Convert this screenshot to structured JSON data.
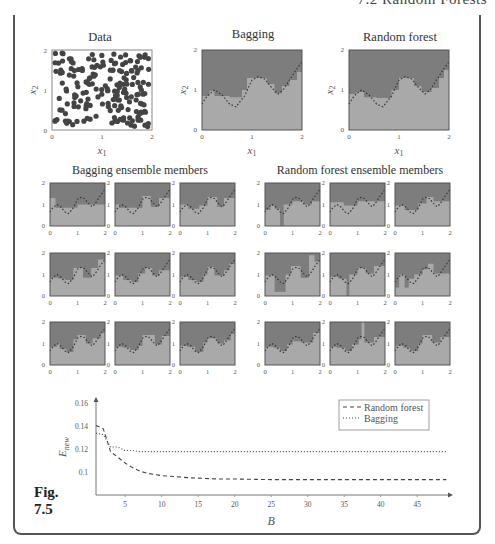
{
  "page": {
    "running_head": "7.2 Random Forests",
    "figure_label": "Fig.",
    "figure_number": "7.5"
  },
  "colors": {
    "class_high": "#7d7d7d",
    "class_low": "#a9a9a9",
    "band": "#b9b9b9",
    "points": "#444444",
    "frame": "#555555",
    "axis": "#777777"
  },
  "top_row": {
    "data_plot": {
      "title": "Data",
      "xlabel": "x1",
      "ylabel": "x2",
      "xticks": [
        "0",
        "1",
        "2"
      ],
      "yticks": [
        "0",
        "1",
        "2"
      ]
    },
    "bagging_plot": {
      "title": "Bagging",
      "xlabel": "x1",
      "ylabel": "x2",
      "xticks": [
        "0",
        "1",
        "2"
      ],
      "yticks": [
        "0",
        "1",
        "2"
      ]
    },
    "rf_plot": {
      "title": "Random forest",
      "xlabel": "x1",
      "ylabel": "x2",
      "xticks": [
        "0",
        "1",
        "2"
      ],
      "yticks": [
        "0",
        "1",
        "2"
      ]
    }
  },
  "ensembles": {
    "bagging_title": "Bagging ensemble members",
    "rf_title": "Random forest ensemble members",
    "xticks": [
      "0",
      "1",
      "2"
    ],
    "yticks": [
      "0",
      "1",
      "2"
    ]
  },
  "chart_data": [
    {
      "type": "line",
      "title": "",
      "xlabel": "B",
      "ylabel": "E_new",
      "x_ticks": [
        5,
        10,
        15,
        20,
        25,
        30,
        35,
        40,
        45
      ],
      "y_ticks": [
        0.1,
        0.12,
        0.14,
        0.16
      ],
      "xlim": [
        1,
        49
      ],
      "ylim": [
        0.08,
        0.165
      ],
      "grid": false,
      "legend_position": "upper right",
      "x": [
        1,
        2,
        3,
        4,
        5,
        6,
        7,
        8,
        9,
        10,
        12,
        14,
        16,
        18,
        20,
        25,
        30,
        35,
        40,
        45,
        49
      ],
      "series": [
        {
          "name": "Random forest",
          "style": "dashed",
          "values": [
            0.141,
            0.138,
            0.118,
            0.113,
            0.108,
            0.104,
            0.101,
            0.099,
            0.098,
            0.097,
            0.096,
            0.095,
            0.0945,
            0.094,
            0.094,
            0.0935,
            0.0935,
            0.0935,
            0.0935,
            0.0935,
            0.0935
          ]
        },
        {
          "name": "Bagging",
          "style": "dotted",
          "values": [
            0.134,
            0.133,
            0.122,
            0.122,
            0.119,
            0.119,
            0.118,
            0.118,
            0.118,
            0.118,
            0.118,
            0.118,
            0.118,
            0.118,
            0.118,
            0.118,
            0.118,
            0.118,
            0.118,
            0.118,
            0.118
          ]
        }
      ]
    },
    {
      "type": "scatter",
      "title": "Data",
      "xlabel": "x1",
      "ylabel": "x2",
      "xlim": [
        0,
        2
      ],
      "ylim": [
        0,
        2
      ],
      "note": "~200 uniformly scattered points on [0,2]x[0,2], with dashed true decision boundary"
    },
    {
      "type": "heatmap",
      "title": "Bagging",
      "xlabel": "x1",
      "ylabel": "x2",
      "xlim": [
        0,
        2
      ],
      "ylim": [
        0,
        2
      ],
      "note": "two-class decision regions; dark = upper class, light = lower class; dashed wavy true boundary"
    },
    {
      "type": "heatmap",
      "title": "Random forest",
      "xlabel": "x1",
      "ylabel": "x2",
      "xlim": [
        0,
        2
      ],
      "ylim": [
        0,
        2
      ]
    }
  ],
  "boundary_true": [
    [
      0,
      0.65
    ],
    [
      0.1,
      0.85
    ],
    [
      0.25,
      1.0
    ],
    [
      0.4,
      0.88
    ],
    [
      0.55,
      0.65
    ],
    [
      0.68,
      0.58
    ],
    [
      0.85,
      0.85
    ],
    [
      1.0,
      1.25
    ],
    [
      1.12,
      1.33
    ],
    [
      1.25,
      1.28
    ],
    [
      1.4,
      1.05
    ],
    [
      1.52,
      0.9
    ],
    [
      1.62,
      1.0
    ],
    [
      1.75,
      1.25
    ],
    [
      1.88,
      1.5
    ],
    [
      2.0,
      1.7
    ]
  ],
  "bagging_region": [
    [
      0,
      0.85
    ],
    [
      0.15,
      0.85
    ],
    [
      0.15,
      0.98
    ],
    [
      0.25,
      0.98
    ],
    [
      0.25,
      0.85
    ],
    [
      0.55,
      0.85
    ],
    [
      0.55,
      0.82
    ],
    [
      0.8,
      0.82
    ],
    [
      0.8,
      1.0
    ],
    [
      0.9,
      1.0
    ],
    [
      0.9,
      1.3
    ],
    [
      1.3,
      1.3
    ],
    [
      1.3,
      1.15
    ],
    [
      1.45,
      1.15
    ],
    [
      1.45,
      0.92
    ],
    [
      1.6,
      0.92
    ],
    [
      1.6,
      1.1
    ],
    [
      1.75,
      1.1
    ],
    [
      1.75,
      1.25
    ],
    [
      1.9,
      1.25
    ],
    [
      1.9,
      1.45
    ],
    [
      2.0,
      1.45
    ]
  ],
  "rf_region": [
    [
      0,
      0.9
    ],
    [
      0.15,
      0.9
    ],
    [
      0.15,
      0.95
    ],
    [
      0.3,
      0.95
    ],
    [
      0.3,
      0.82
    ],
    [
      0.55,
      0.82
    ],
    [
      0.55,
      0.8
    ],
    [
      0.85,
      0.8
    ],
    [
      0.85,
      1.0
    ],
    [
      1.0,
      1.0
    ],
    [
      1.0,
      1.3
    ],
    [
      1.3,
      1.3
    ],
    [
      1.3,
      1.1
    ],
    [
      1.45,
      1.1
    ],
    [
      1.45,
      0.95
    ],
    [
      1.65,
      0.95
    ],
    [
      1.65,
      1.05
    ],
    [
      1.8,
      1.05
    ],
    [
      1.8,
      1.3
    ],
    [
      1.9,
      1.3
    ],
    [
      1.9,
      1.5
    ],
    [
      2.0,
      1.5
    ]
  ],
  "members": {
    "bagging": [
      [
        [
          0,
          1.3
        ],
        [
          0.2,
          1.3
        ],
        [
          0.2,
          0.85
        ],
        [
          1.0,
          0.85
        ],
        [
          1.0,
          1.0
        ],
        [
          2.0,
          1.0
        ]
      ],
      [
        [
          0,
          1.0
        ],
        [
          0.15,
          1.0
        ],
        [
          0.15,
          0.85
        ],
        [
          1.0,
          0.85
        ],
        [
          1.0,
          1.4
        ],
        [
          1.3,
          1.4
        ],
        [
          1.3,
          0.9
        ],
        [
          1.6,
          0.9
        ],
        [
          1.6,
          1.3
        ],
        [
          2.0,
          1.3
        ]
      ],
      [
        [
          0,
          1.0
        ],
        [
          0.3,
          1.0
        ],
        [
          0.3,
          0.8
        ],
        [
          0.7,
          0.8
        ],
        [
          0.7,
          0.95
        ],
        [
          1.0,
          0.95
        ],
        [
          1.0,
          1.35
        ],
        [
          1.35,
          1.35
        ],
        [
          1.35,
          0.9
        ],
        [
          1.6,
          0.9
        ],
        [
          1.6,
          1.3
        ],
        [
          2.0,
          1.3
        ]
      ],
      [
        [
          0,
          0.85
        ],
        [
          0.3,
          0.85
        ],
        [
          0.3,
          0.8
        ],
        [
          0.55,
          0.8
        ],
        [
          0.55,
          0.75
        ],
        [
          0.85,
          0.75
        ],
        [
          0.85,
          1.3
        ],
        [
          1.2,
          1.3
        ],
        [
          1.2,
          0.85
        ],
        [
          1.5,
          0.85
        ],
        [
          1.5,
          1.3
        ],
        [
          1.75,
          1.3
        ],
        [
          1.75,
          1.7
        ],
        [
          2.0,
          1.7
        ]
      ],
      [
        [
          0,
          0.95
        ],
        [
          0.3,
          0.95
        ],
        [
          0.3,
          0.75
        ],
        [
          0.6,
          0.75
        ],
        [
          0.6,
          0.65
        ],
        [
          0.85,
          0.65
        ],
        [
          0.85,
          1.05
        ],
        [
          1.1,
          1.05
        ],
        [
          1.1,
          1.3
        ],
        [
          1.35,
          1.3
        ],
        [
          1.35,
          0.95
        ],
        [
          1.6,
          0.95
        ],
        [
          1.6,
          1.2
        ],
        [
          2.0,
          1.2
        ]
      ],
      [
        [
          0,
          0.9
        ],
        [
          0.3,
          0.9
        ],
        [
          0.3,
          0.75
        ],
        [
          0.6,
          0.75
        ],
        [
          0.6,
          0.65
        ],
        [
          0.85,
          0.65
        ],
        [
          0.85,
          1.0
        ],
        [
          1.0,
          1.0
        ],
        [
          1.0,
          1.35
        ],
        [
          1.25,
          1.35
        ],
        [
          1.25,
          0.95
        ],
        [
          1.6,
          0.95
        ],
        [
          1.6,
          1.2
        ],
        [
          1.8,
          1.2
        ],
        [
          1.8,
          1.5
        ],
        [
          2.0,
          1.5
        ]
      ],
      [
        [
          0,
          0.85
        ],
        [
          0.25,
          0.85
        ],
        [
          0.25,
          1.0
        ],
        [
          0.35,
          1.0
        ],
        [
          0.35,
          0.75
        ],
        [
          0.6,
          0.75
        ],
        [
          0.6,
          0.6
        ],
        [
          0.85,
          0.6
        ],
        [
          0.85,
          1.2
        ],
        [
          1.0,
          1.2
        ],
        [
          1.0,
          1.4
        ],
        [
          1.3,
          1.4
        ],
        [
          1.3,
          1.0
        ],
        [
          1.55,
          1.0
        ],
        [
          1.55,
          1.25
        ],
        [
          1.85,
          1.25
        ],
        [
          1.85,
          1.5
        ],
        [
          2.0,
          1.5
        ]
      ],
      [
        [
          0,
          0.85
        ],
        [
          0.3,
          0.85
        ],
        [
          0.3,
          0.8
        ],
        [
          0.55,
          0.8
        ],
        [
          0.55,
          0.7
        ],
        [
          0.85,
          0.7
        ],
        [
          0.85,
          0.9
        ],
        [
          1.0,
          0.9
        ],
        [
          1.0,
          1.4
        ],
        [
          1.45,
          1.4
        ],
        [
          1.45,
          0.95
        ],
        [
          1.7,
          0.95
        ],
        [
          1.7,
          1.35
        ],
        [
          2.0,
          1.35
        ]
      ],
      [
        [
          0,
          0.9
        ],
        [
          0.25,
          0.9
        ],
        [
          0.25,
          0.85
        ],
        [
          0.55,
          0.85
        ],
        [
          0.55,
          0.6
        ],
        [
          0.85,
          0.6
        ],
        [
          0.85,
          1.05
        ],
        [
          1.0,
          1.05
        ],
        [
          1.0,
          1.25
        ],
        [
          1.35,
          1.25
        ],
        [
          1.35,
          1.0
        ],
        [
          1.6,
          1.0
        ],
        [
          1.6,
          1.15
        ],
        [
          1.85,
          1.15
        ],
        [
          1.85,
          1.45
        ],
        [
          2.0,
          1.45
        ]
      ]
    ],
    "rf": [
      [
        [
          0,
          0.75
        ],
        [
          0.2,
          0.75
        ],
        [
          0.2,
          0.95
        ],
        [
          0.35,
          0.95
        ],
        [
          0.35,
          0.8
        ],
        [
          0.55,
          0.8
        ],
        [
          0.55,
          0.0
        ],
        [
          0.68,
          0.0
        ],
        [
          0.68,
          1.0
        ],
        [
          1.0,
          1.0
        ],
        [
          1.0,
          1.15
        ],
        [
          1.4,
          1.15
        ],
        [
          1.4,
          1.0
        ],
        [
          1.7,
          1.0
        ],
        [
          1.7,
          1.15
        ],
        [
          2.0,
          1.15
        ]
      ],
      [
        [
          0,
          1.1
        ],
        [
          0.5,
          1.1
        ],
        [
          0.5,
          0.95
        ],
        [
          1.0,
          0.95
        ],
        [
          1.0,
          1.15
        ],
        [
          2.0,
          1.15
        ]
      ],
      [
        [
          0,
          0.95
        ],
        [
          0.35,
          0.95
        ],
        [
          0.35,
          0.75
        ],
        [
          0.85,
          0.75
        ],
        [
          0.85,
          1.05
        ],
        [
          1.15,
          1.05
        ],
        [
          1.15,
          1.35
        ],
        [
          1.4,
          1.35
        ],
        [
          1.4,
          1.15
        ],
        [
          2.0,
          1.15
        ]
      ],
      [
        [
          0,
          0.95
        ],
        [
          0.35,
          0.95
        ],
        [
          0.35,
          0.2
        ],
        [
          0.75,
          0.2
        ],
        [
          0.75,
          1.0
        ],
        [
          0.95,
          1.0
        ],
        [
          0.95,
          1.4
        ],
        [
          1.3,
          1.4
        ],
        [
          1.3,
          0.85
        ],
        [
          1.6,
          0.85
        ],
        [
          1.6,
          1.9
        ],
        [
          1.8,
          1.9
        ],
        [
          1.8,
          1.6
        ],
        [
          2.0,
          1.6
        ]
      ],
      [
        [
          0,
          0.9
        ],
        [
          0.3,
          0.9
        ],
        [
          0.3,
          0.8
        ],
        [
          0.6,
          0.8
        ],
        [
          0.6,
          0.0
        ],
        [
          0.7,
          0.0
        ],
        [
          0.7,
          1.0
        ],
        [
          1.0,
          1.0
        ],
        [
          1.0,
          1.3
        ],
        [
          1.3,
          1.3
        ],
        [
          1.3,
          1.05
        ],
        [
          1.6,
          1.05
        ],
        [
          1.6,
          1.4
        ],
        [
          2.0,
          1.4
        ]
      ],
      [
        [
          0,
          0.4
        ],
        [
          0.15,
          0.4
        ],
        [
          0.15,
          1.0
        ],
        [
          0.35,
          1.0
        ],
        [
          0.35,
          0.4
        ],
        [
          0.5,
          0.4
        ],
        [
          0.5,
          0.8
        ],
        [
          0.7,
          0.8
        ],
        [
          0.7,
          1.0
        ],
        [
          1.0,
          1.0
        ],
        [
          1.0,
          1.25
        ],
        [
          1.2,
          1.25
        ],
        [
          1.2,
          1.5
        ],
        [
          1.4,
          1.5
        ],
        [
          1.4,
          1.05
        ],
        [
          2.0,
          1.05
        ],
        [
          2.0,
          1.7
        ]
      ],
      [
        [
          0,
          0.85
        ],
        [
          0.3,
          0.85
        ],
        [
          0.3,
          0.8
        ],
        [
          0.55,
          0.8
        ],
        [
          0.55,
          0.65
        ],
        [
          0.8,
          0.65
        ],
        [
          0.8,
          0.95
        ],
        [
          1.0,
          0.95
        ],
        [
          1.0,
          1.1
        ],
        [
          1.3,
          1.1
        ],
        [
          1.3,
          1.05
        ],
        [
          1.75,
          1.05
        ],
        [
          1.75,
          1.5
        ],
        [
          2.0,
          1.5
        ]
      ],
      [
        [
          0,
          0.85
        ],
        [
          0.25,
          0.85
        ],
        [
          0.25,
          0.8
        ],
        [
          0.55,
          0.8
        ],
        [
          0.55,
          0.65
        ],
        [
          0.8,
          0.65
        ],
        [
          0.8,
          0.95
        ],
        [
          1.05,
          0.95
        ],
        [
          1.05,
          1.2
        ],
        [
          1.15,
          1.2
        ],
        [
          1.15,
          2.0
        ],
        [
          1.25,
          2.0
        ],
        [
          1.25,
          1.05
        ],
        [
          1.6,
          1.05
        ],
        [
          1.6,
          1.3
        ],
        [
          2.0,
          1.3
        ]
      ],
      [
        [
          0,
          0.9
        ],
        [
          0.3,
          0.9
        ],
        [
          0.3,
          0.8
        ],
        [
          0.55,
          0.8
        ],
        [
          0.55,
          0.65
        ],
        [
          0.85,
          0.65
        ],
        [
          0.85,
          1.0
        ],
        [
          1.0,
          1.0
        ],
        [
          1.0,
          1.4
        ],
        [
          1.35,
          1.4
        ],
        [
          1.35,
          1.05
        ],
        [
          1.65,
          1.05
        ],
        [
          1.65,
          1.3
        ],
        [
          2.0,
          1.3
        ]
      ]
    ]
  }
}
